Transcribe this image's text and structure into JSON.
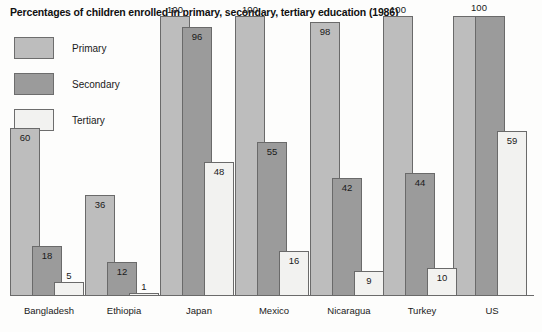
{
  "chart_data": {
    "type": "bar",
    "title": "Percentages of children enrolled in primary, secondary, tertiary education (1986)",
    "xlabel": "",
    "ylabel": "",
    "ylim": [
      0,
      100
    ],
    "grid": false,
    "legend_position": "top-left",
    "categories": [
      "Bangladesh",
      "Ethiopia",
      "Japan",
      "Mexico",
      "Nicaragua",
      "Turkey",
      "US"
    ],
    "series": [
      {
        "name": "Primary",
        "color": "#bdbdbd",
        "values": [
          60,
          36,
          100,
          100,
          98,
          100,
          100
        ]
      },
      {
        "name": "Secondary",
        "color": "#9b9b9b",
        "values": [
          18,
          12,
          96,
          55,
          42,
          44,
          100
        ]
      },
      {
        "name": "Tertiary",
        "color": "#f2f2f0",
        "values": [
          5,
          1,
          48,
          16,
          9,
          10,
          59
        ]
      }
    ],
    "value_labels": {
      "Bangladesh": {
        "Primary": "60",
        "Secondary": "18",
        "Tertiary": "5"
      },
      "Ethiopia": {
        "Primary": "36",
        "Secondary": "12",
        "Tertiary": "1"
      },
      "Japan": {
        "Primary": "100",
        "Secondary": "96",
        "Tertiary": "48"
      },
      "Mexico": {
        "Primary": "100",
        "Secondary": "55",
        "Tertiary": "16"
      },
      "Nicaragua": {
        "Primary": "98",
        "Secondary": "42",
        "Tertiary": "9"
      },
      "Turkey": {
        "Primary": "100",
        "Secondary": "44",
        "Tertiary": "10"
      },
      "US": {
        "Primary": "100",
        "Secondary": "100",
        "Tertiary": "59"
      }
    },
    "annotations": [
      "US primary and secondary share a single 100 label",
      "Ethiopia tertiary bar is a thin sliver labelled above the bar"
    ]
  },
  "legend": {
    "items": [
      {
        "label": "Primary",
        "color": "#bdbdbd"
      },
      {
        "label": "Secondary",
        "color": "#9b9b9b"
      },
      {
        "label": "Tertiary",
        "color": "#f2f2f0"
      }
    ]
  },
  "axis": {
    "tick_labels": [
      "Bangladesh",
      "Ethiopia",
      "Japan",
      "Mexico",
      "Nicaragua",
      "Turkey",
      "US"
    ]
  }
}
